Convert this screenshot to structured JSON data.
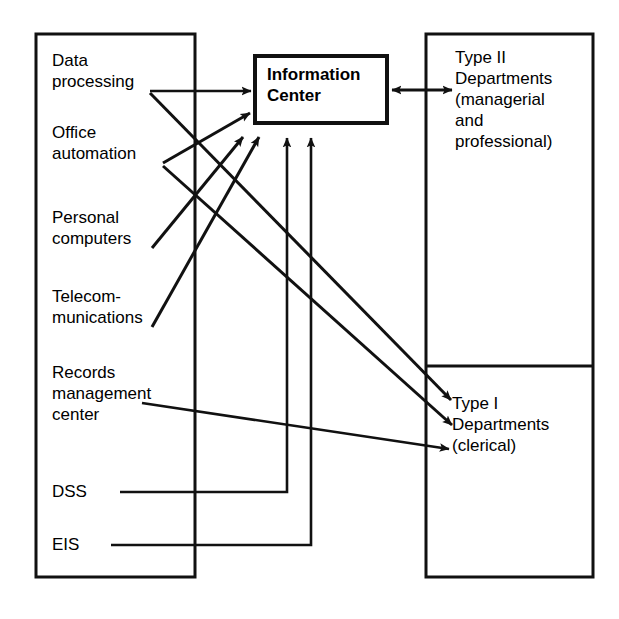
{
  "diagram": {
    "colors": {
      "stroke": "#111111",
      "background": "#ffffff",
      "text": "#000000"
    },
    "left_box": {
      "name": "information-systems-functions-box",
      "items": [
        {
          "id": "data-processing",
          "label": "Data\nprocessing"
        },
        {
          "id": "office-automation",
          "label": "Office\nautomation"
        },
        {
          "id": "personal-computers",
          "label": "Personal\ncomputers"
        },
        {
          "id": "telecommunications",
          "label": "Telecom-\nmunications"
        },
        {
          "id": "records-management-center",
          "label": "Records\nmanagement\ncenter"
        },
        {
          "id": "dss",
          "label": "DSS"
        },
        {
          "id": "eis",
          "label": "EIS"
        }
      ]
    },
    "center_box": {
      "name": "information-center-box",
      "label": "Information\nCenter"
    },
    "right_box": {
      "name": "departments-box",
      "sections": [
        {
          "id": "type-ii-departments",
          "label": "Type II\nDepartments\n(managerial\nand\nprofessional)"
        },
        {
          "id": "type-i-departments",
          "label": "Type I\nDepartments\n(clerical)"
        }
      ]
    },
    "connections": [
      {
        "id": "data-processing-to-information-center",
        "from": "data-processing",
        "to": "information-center",
        "arrow": "single"
      },
      {
        "id": "data-processing-to-type-i",
        "from": "data-processing",
        "to": "type-i-departments",
        "arrow": "single"
      },
      {
        "id": "office-automation-to-information-center",
        "from": "office-automation",
        "to": "information-center",
        "arrow": "single"
      },
      {
        "id": "office-automation-to-type-i",
        "from": "office-automation",
        "to": "type-i-departments",
        "arrow": "single"
      },
      {
        "id": "personal-computers-to-information-center",
        "from": "personal-computers",
        "to": "information-center",
        "arrow": "single"
      },
      {
        "id": "telecommunications-to-information-center",
        "from": "telecommunications",
        "to": "information-center",
        "arrow": "single"
      },
      {
        "id": "records-management-center-to-type-i",
        "from": "records-management-center",
        "to": "type-i-departments",
        "arrow": "single"
      },
      {
        "id": "dss-to-information-center",
        "from": "dss",
        "to": "information-center",
        "arrow": "single"
      },
      {
        "id": "eis-to-information-center",
        "from": "eis",
        "to": "information-center",
        "arrow": "single"
      },
      {
        "id": "information-center-to-type-ii",
        "from": "information-center",
        "to": "type-ii-departments",
        "arrow": "double"
      }
    ]
  }
}
